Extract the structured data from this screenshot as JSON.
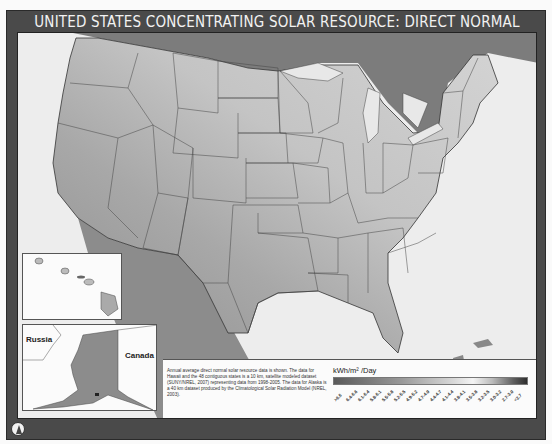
{
  "title": "UNITED STATES CONCENTRATING SOLAR RESOURCE: DIRECT NORMAL",
  "insets": {
    "hawaii": {
      "label": ""
    },
    "alaska": {
      "labels": [
        "Russia",
        "Canada"
      ]
    }
  },
  "notes": "Annual average direct normal solar resource data is shown. The data for Hawaii and the 48 contiguous states is a 10 km, satellite modeled dataset (SUNY/NREL, 2007) representing data from 1998-2005. The data for Alaska is a 40 km dataset produced by the Climatological Solar Radiation Model (NREL, 2003).",
  "legend": {
    "title": "kWh/m² /Day",
    "ticks": [
      ">6.6",
      "6.4-6.6",
      "6.1-6.4",
      "5.8-6.1",
      "5.5-5.8",
      "5.2-5.5",
      "4.9-5.2",
      "4.7-4.9",
      "4.4-4.7",
      "4.1-4.4",
      "3.8-4.1",
      "3.5-3.8",
      "3.2-3.5",
      "3.0-3.2",
      "2.7-3.0",
      "<2.7"
    ]
  },
  "north_arrow": "north-arrow",
  "colors": {
    "frame": "#4a4a4a",
    "water": "#ededed",
    "land_high": "#8a8a8a",
    "land_mid": "#b5b5b5",
    "land_low": "#d0d0d0",
    "canada": "#7a7a7a"
  }
}
